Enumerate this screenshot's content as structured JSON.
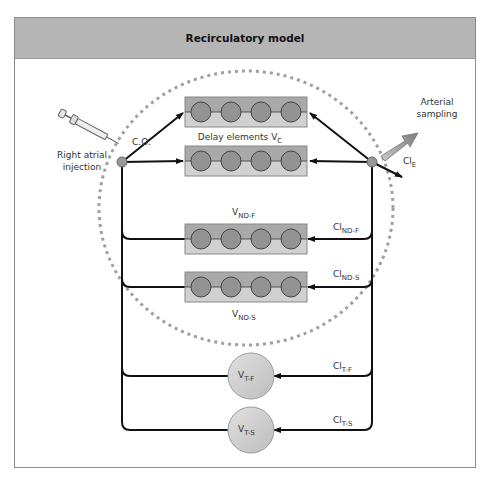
{
  "title": "Recirculatory model",
  "labels": {
    "injection_line1": "Right atrial",
    "injection_line2": "injection",
    "cardiac_output": "C.O.",
    "delay_elements": "Delay elements V",
    "delay_elements_sub": "C",
    "arterial_line1": "Arterial",
    "arterial_line2": "sampling",
    "cl_e": "Cl",
    "cl_e_sub": "E",
    "v_nd_f": "V",
    "v_nd_f_sub": "ND-F",
    "cl_nd_f": "Cl",
    "cl_nd_f_sub": "ND-F",
    "v_nd_s": "V",
    "v_nd_s_sub": "ND-S",
    "cl_nd_s": "Cl",
    "cl_nd_s_sub": "ND-S",
    "v_t_f": "V",
    "v_t_f_sub": "T-F",
    "cl_t_f": "Cl",
    "cl_t_f_sub": "T-F",
    "v_t_s": "V",
    "v_t_s_sub": "T-S",
    "cl_t_s": "Cl",
    "cl_t_s_sub": "T-S"
  },
  "colors": {
    "header_bg": "#b5b5b5",
    "box_top": "#a9a9a9",
    "box_bottom": "#d0d0d0",
    "element_fill": "#939393",
    "tissue_fill": "#cfcfcf",
    "dashed_circle": "#a0a0a0",
    "line": "#111111"
  }
}
